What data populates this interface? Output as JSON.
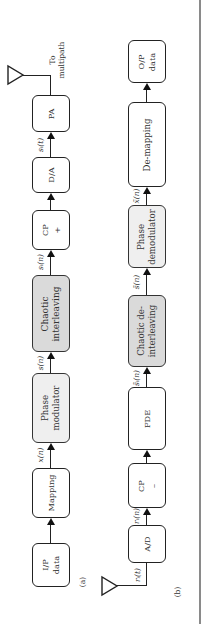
{
  "figure": {
    "panel_a": {
      "label": "(a)",
      "title": "Transmitter",
      "blocks": [
        {
          "id": "ip_data",
          "lines": [
            "I/P",
            "data"
          ],
          "shade": "none"
        },
        {
          "id": "mapping",
          "lines": [
            "Mapping"
          ],
          "shade": "none"
        },
        {
          "id": "phase_modulator",
          "lines": [
            "Phase",
            "modulator"
          ],
          "shade": "light"
        },
        {
          "id": "chaotic_interleaving",
          "lines": [
            "Chaotic",
            "interleaving"
          ],
          "shade": "dark"
        },
        {
          "id": "cp_add",
          "lines": [
            "CP",
            "+"
          ],
          "shade": "none"
        },
        {
          "id": "da",
          "lines": [
            "D/A"
          ],
          "shade": "none"
        },
        {
          "id": "pa",
          "lines": [
            "PA"
          ],
          "shade": "none"
        }
      ],
      "signals": [
        "x(n)",
        "s(n)",
        "s_I(n)",
        "s_I(t)"
      ],
      "signals_display": [
        "x(n)",
        "s(n)",
        "sᵢ(n)",
        "sᵢ(t)"
      ],
      "output_label_lines": [
        "To",
        "multipath"
      ]
    },
    "panel_b": {
      "label": "(b)",
      "title": "Receiver",
      "blocks": [
        {
          "id": "ad",
          "lines": [
            "A/D"
          ],
          "shade": "none"
        },
        {
          "id": "cp_remove",
          "lines": [
            "CP",
            "–"
          ],
          "shade": "none"
        },
        {
          "id": "fde",
          "lines": [
            "FDE"
          ],
          "shade": "none"
        },
        {
          "id": "chaotic_deinterleaving",
          "lines": [
            "Chaotic de-",
            "interleaving"
          ],
          "shade": "dark"
        },
        {
          "id": "phase_demodulator",
          "lines": [
            "Phase",
            "demodulator"
          ],
          "shade": "light"
        },
        {
          "id": "demapping",
          "lines": [
            "De-mapping"
          ],
          "shade": "none"
        },
        {
          "id": "op_data",
          "lines": [
            "O/P",
            "data"
          ],
          "shade": "none"
        }
      ],
      "signals": [
        "r_I(t)",
        "r_I(n)",
        "s~_I(n)",
        "s~(n)",
        "x~(n)"
      ],
      "signals_display": [
        "rᵢ(t)",
        "rᵢ(n)",
        "s̃ᵢ(n)",
        "s̃(n)",
        "x̃(n)"
      ]
    },
    "colors": {
      "dark_shade": "#dadada",
      "light_shade": "#efefef",
      "stroke": "#222222",
      "side_rule": "#8a8a8a"
    },
    "orientation": "rotated 90 degrees counter-clockwise"
  }
}
